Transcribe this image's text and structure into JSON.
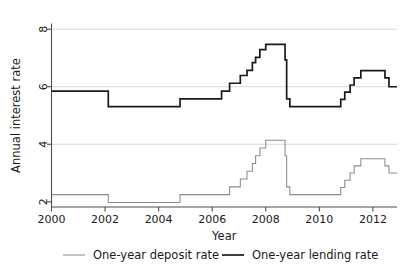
{
  "chart_data": {
    "type": "line",
    "title": "",
    "xlabel": "Year",
    "ylabel": "Annual interest rate",
    "xlim": [
      2000.0,
      2012.9
    ],
    "ylim": [
      1.82,
      8.18
    ],
    "xticks": [
      2000,
      2002,
      2004,
      2006,
      2008,
      2010,
      2012
    ],
    "xtick_labels": [
      "2000",
      "2002",
      "2004",
      "2006",
      "2008",
      "2010",
      "2012"
    ],
    "yticks": [
      2,
      4,
      6,
      8
    ],
    "ytick_labels": [
      "2",
      "4",
      "6",
      "8"
    ],
    "grid": "horizontal-major",
    "gridlines_y": [
      4,
      6,
      8
    ],
    "legend_position": "below-outside",
    "colors": {
      "deposit": "#8c8c8c",
      "lending": "#1a1a1a",
      "axis": "#4d4d4d",
      "grid": "#d9d9d9",
      "background": "#ffffff"
    },
    "step_type": "post",
    "series": [
      {
        "name": "One-year deposit rate",
        "color": "#8c8c8c",
        "x": [
          2000.0,
          2002.12,
          2004.8,
          2006.65,
          2007.05,
          2007.3,
          2007.5,
          2007.62,
          2007.78,
          2008.0,
          2008.72,
          2008.78,
          2008.9,
          2010.8,
          2010.95,
          2011.15,
          2011.3,
          2011.55,
          2012.45,
          2012.6,
          2012.9
        ],
        "y": [
          2.25,
          1.98,
          2.25,
          2.52,
          2.79,
          3.06,
          3.33,
          3.6,
          3.87,
          4.14,
          3.6,
          2.52,
          2.25,
          2.5,
          2.75,
          3.0,
          3.25,
          3.5,
          3.25,
          3.0,
          3.0
        ]
      },
      {
        "name": "One-year lending rate",
        "color": "#1a1a1a",
        "x": [
          2000.0,
          2002.12,
          2004.8,
          2006.35,
          2006.65,
          2007.05,
          2007.3,
          2007.5,
          2007.62,
          2007.78,
          2008.0,
          2008.72,
          2008.78,
          2008.9,
          2010.8,
          2010.95,
          2011.15,
          2011.3,
          2011.55,
          2012.45,
          2012.6,
          2012.9
        ],
        "y": [
          5.85,
          5.31,
          5.58,
          5.85,
          6.12,
          6.39,
          6.57,
          6.84,
          7.02,
          7.29,
          7.47,
          6.93,
          5.58,
          5.31,
          5.56,
          5.81,
          6.06,
          6.31,
          6.56,
          6.31,
          6.0,
          6.0
        ]
      }
    ],
    "annotations": []
  },
  "legend": {
    "entries": [
      {
        "label": "One-year deposit rate",
        "series_key": "deposit"
      },
      {
        "label": "One-year lending rate",
        "series_key": "lending"
      }
    ]
  }
}
